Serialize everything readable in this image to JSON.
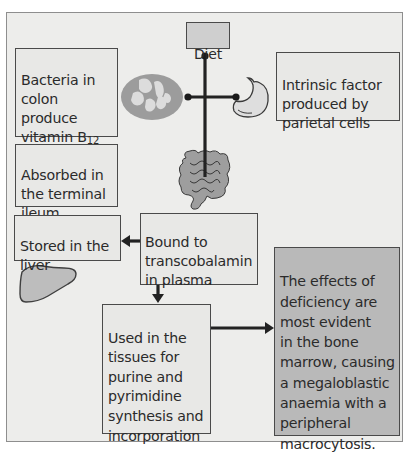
{
  "diagram": {
    "colors": {
      "frame_bg": "#ededeb",
      "frame_border": "#8e8e8e",
      "box_border": "#4a4a4a",
      "box_bg": "#e8e8e6",
      "diet_bg": "#cfcfcf",
      "effects_bg": "#b9b9b9",
      "organ_fill": "#b5b5b5",
      "line": "#222222"
    },
    "nodes": {
      "diet": {
        "label": "Diet"
      },
      "bacteria": {
        "label_main": "Bacteria in\ncolon\nproduce\nvitamin B",
        "label_sub": "12"
      },
      "intrinsic": {
        "label": "Intrinsic factor\nproduced by\nparietal cells"
      },
      "absorbed": {
        "label": "Absorbed in\nthe terminal\nileum"
      },
      "stored": {
        "label": "Stored in the\nliver"
      },
      "bound": {
        "label": "Bound to\ntranscobalamin\nin plasma"
      },
      "used": {
        "label": "Used in the\ntissues for\npurine and\npyrimidine\nsynthesis and\nincorporation"
      },
      "effects": {
        "label": "The effects of\ndeficiency are\nmost evident\nin the bone\nmarrow, causing\na megaloblastic\nanaemia with a\nperipheral\nmacrocytosis."
      }
    },
    "icons": [
      "bacteria-icon",
      "stomach-icon",
      "intestine-icon",
      "liver-icon"
    ],
    "edges": [
      {
        "from": "diet",
        "to": "intestine",
        "type": "line"
      },
      {
        "from": "bacteria",
        "to": "diet-line",
        "type": "line"
      },
      {
        "from": "stomach",
        "to": "diet-line",
        "type": "line"
      },
      {
        "from": "bound",
        "to": "stored",
        "type": "arrow"
      },
      {
        "from": "bound",
        "to": "used",
        "type": "arrow"
      },
      {
        "from": "used",
        "to": "effects",
        "type": "arrow"
      }
    ]
  }
}
